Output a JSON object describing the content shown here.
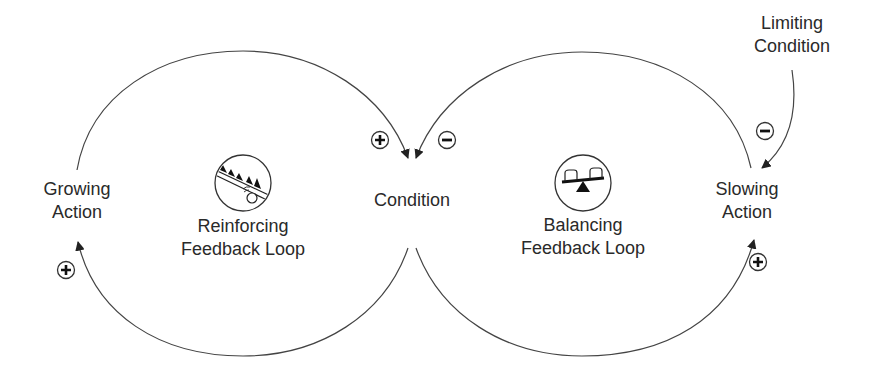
{
  "diagram": {
    "type": "causal-loop-diagram",
    "nodes": {
      "growing_action": {
        "line1": "Growing",
        "line2": "Action"
      },
      "condition": {
        "label": "Condition"
      },
      "slowing_action": {
        "line1": "Slowing",
        "line2": "Action"
      },
      "limiting_condition": {
        "line1": "Limiting",
        "line2": "Condition"
      }
    },
    "loops": {
      "reinforcing": {
        "line1": "Reinforcing",
        "line2": "Feedback Loop",
        "icon": "snowball-rolling-downhill-icon"
      },
      "balancing": {
        "line1": "Balancing",
        "line2": "Feedback Loop",
        "icon": "seesaw-icon"
      }
    },
    "links": [
      {
        "from": "Growing Action",
        "to": "Condition",
        "polarity": "+"
      },
      {
        "from": "Condition",
        "to": "Growing Action",
        "polarity": "+"
      },
      {
        "from": "Slowing Action",
        "to": "Condition",
        "polarity": "-"
      },
      {
        "from": "Condition",
        "to": "Slowing Action",
        "polarity": "+"
      },
      {
        "from": "Limiting Condition",
        "to": "Slowing Action",
        "polarity": "-"
      }
    ],
    "colors": {
      "line": "#444444",
      "text": "#2a2a2a",
      "background": "#ffffff"
    }
  }
}
